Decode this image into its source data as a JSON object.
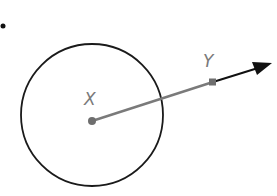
{
  "diagram": {
    "type": "geometry",
    "bullet": "•",
    "circle": {
      "cx": 92,
      "cy": 115,
      "r": 71,
      "stroke": "#1a1a1a"
    },
    "points": [
      {
        "label": "X",
        "x": 92,
        "y": 121,
        "label_x": 85,
        "label_y": 104,
        "color": "#6e6e6e"
      },
      {
        "label": "Y",
        "x": 213,
        "y": 82,
        "label_x": 204,
        "label_y": 66,
        "color": "#6e6e6e"
      }
    ],
    "segment_xy": {
      "from": "X",
      "to": "Y",
      "color": "#7a7a7a"
    },
    "ray": {
      "from": "Y",
      "tip_x": 272,
      "tip_y": 63,
      "color": "#111111"
    }
  }
}
